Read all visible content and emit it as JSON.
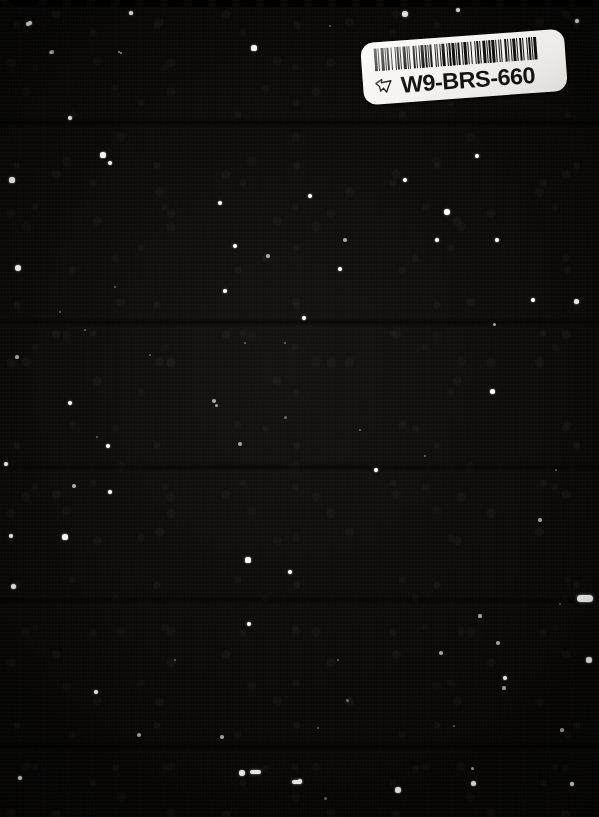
{
  "image": {
    "kind": "scanned-book-cover",
    "description": "Dark starfield / night sky book cover scan",
    "width": 599,
    "height": 817,
    "background_color": "#0b0908"
  },
  "label": {
    "name": "library-barcode-label",
    "code_text": "W9-BRS-660",
    "background_color": "#f6f5f1",
    "ink_color": "#141414",
    "icon": "pointing-hand-icon",
    "rotation_degrees": -4.2,
    "barcode": {
      "symbology": "code-39",
      "bars": [
        3,
        1,
        1,
        2,
        3,
        1,
        1,
        1,
        2,
        2,
        1,
        3,
        1,
        1,
        2,
        1,
        1,
        2,
        3,
        1,
        1,
        1,
        1,
        3,
        2,
        1,
        1,
        2,
        1,
        1,
        3,
        1,
        2,
        1,
        1,
        1,
        2,
        3,
        1,
        1,
        1,
        2,
        1,
        1,
        3,
        2,
        1,
        1,
        2,
        1,
        3,
        1,
        1,
        1,
        2,
        2,
        1,
        1,
        3,
        1,
        1,
        2,
        1,
        3,
        1,
        1,
        2,
        1,
        1,
        2,
        3,
        1,
        1,
        1,
        2,
        1,
        3,
        1,
        1,
        2,
        1,
        1,
        1,
        3,
        2,
        1,
        1,
        2,
        1,
        1,
        3,
        1,
        1,
        2,
        2,
        1,
        1,
        3,
        1,
        1,
        2,
        1,
        1,
        1,
        3,
        2
      ]
    }
  },
  "starfield": {
    "name": "starfield",
    "star_count": 118,
    "star_color": "#ffffff",
    "stars": [
      {
        "x": 405,
        "y": 14,
        "r": 3.0,
        "c": "bright"
      },
      {
        "x": 458,
        "y": 10,
        "r": 2.0,
        "c": "bright"
      },
      {
        "x": 577,
        "y": 21,
        "r": 2.4,
        "c": "bright"
      },
      {
        "x": 28,
        "y": 24,
        "r": 2.2,
        "c": "bright"
      },
      {
        "x": 131,
        "y": 13,
        "r": 1.8,
        "c": "bright"
      },
      {
        "x": 254,
        "y": 48,
        "r": 2.6,
        "c": "bright"
      },
      {
        "x": 330,
        "y": 26,
        "r": 1.3,
        "c": "faint"
      },
      {
        "x": 30,
        "y": 23,
        "r": 2.3,
        "c": "bright"
      },
      {
        "x": 50,
        "y": 52,
        "r": 1.5,
        "c": "dim"
      },
      {
        "x": 119,
        "y": 52,
        "r": 1.4,
        "c": "dim"
      },
      {
        "x": 103,
        "y": 155,
        "r": 2.6,
        "c": "bright"
      },
      {
        "x": 52,
        "y": 52,
        "r": 1.6,
        "c": "dim"
      },
      {
        "x": 121,
        "y": 53,
        "r": 1.4,
        "c": "dim"
      },
      {
        "x": 70,
        "y": 118,
        "r": 2.1,
        "c": "bright"
      },
      {
        "x": 12,
        "y": 180,
        "r": 2.6,
        "c": "bright"
      },
      {
        "x": 110,
        "y": 163,
        "r": 2.0,
        "c": "bright"
      },
      {
        "x": 405,
        "y": 180,
        "r": 2.2,
        "c": "bright"
      },
      {
        "x": 477,
        "y": 156,
        "r": 1.9,
        "c": "bright"
      },
      {
        "x": 220,
        "y": 203,
        "r": 2.3,
        "c": "bright"
      },
      {
        "x": 310,
        "y": 196,
        "r": 2.0,
        "c": "bright"
      },
      {
        "x": 447,
        "y": 212,
        "r": 2.9,
        "c": "bright"
      },
      {
        "x": 497,
        "y": 240,
        "r": 2.2,
        "c": "bright"
      },
      {
        "x": 235,
        "y": 246,
        "r": 2.1,
        "c": "bright"
      },
      {
        "x": 340,
        "y": 269,
        "r": 2.3,
        "c": "bright"
      },
      {
        "x": 268,
        "y": 256,
        "r": 1.6,
        "c": "dim"
      },
      {
        "x": 345,
        "y": 240,
        "r": 1.8,
        "c": "dim"
      },
      {
        "x": 18,
        "y": 268,
        "r": 3.3,
        "c": "bright"
      },
      {
        "x": 225,
        "y": 291,
        "r": 2.2,
        "c": "bright"
      },
      {
        "x": 304,
        "y": 318,
        "r": 2.3,
        "c": "bright"
      },
      {
        "x": 437,
        "y": 240,
        "r": 2.0,
        "c": "bright"
      },
      {
        "x": 576,
        "y": 301,
        "r": 2.5,
        "c": "bright"
      },
      {
        "x": 115,
        "y": 287,
        "r": 1.4,
        "c": "faint"
      },
      {
        "x": 85,
        "y": 330,
        "r": 1.3,
        "c": "faint"
      },
      {
        "x": 494,
        "y": 324,
        "r": 1.5,
        "c": "dim"
      },
      {
        "x": 533,
        "y": 300,
        "r": 2.4,
        "c": "bright"
      },
      {
        "x": 17,
        "y": 357,
        "r": 1.6,
        "c": "dim"
      },
      {
        "x": 245,
        "y": 343,
        "r": 1.4,
        "c": "faint"
      },
      {
        "x": 70,
        "y": 403,
        "r": 2.1,
        "c": "bright"
      },
      {
        "x": 492,
        "y": 391,
        "r": 2.5,
        "c": "bright"
      },
      {
        "x": 214,
        "y": 401,
        "r": 1.8,
        "c": "dim"
      },
      {
        "x": 376,
        "y": 470,
        "r": 2.3,
        "c": "bright"
      },
      {
        "x": 108,
        "y": 446,
        "r": 2.4,
        "c": "bright"
      },
      {
        "x": 240,
        "y": 444,
        "r": 1.9,
        "c": "dim"
      },
      {
        "x": 6,
        "y": 464,
        "r": 2.4,
        "c": "bright"
      },
      {
        "x": 285,
        "y": 417,
        "r": 1.5,
        "c": "faint"
      },
      {
        "x": 74,
        "y": 486,
        "r": 1.7,
        "c": "dim"
      },
      {
        "x": 110,
        "y": 492,
        "r": 2.4,
        "c": "bright"
      },
      {
        "x": 216,
        "y": 405,
        "r": 1.5,
        "c": "dim"
      },
      {
        "x": 11,
        "y": 536,
        "r": 2.1,
        "c": "bright"
      },
      {
        "x": 65,
        "y": 537,
        "r": 2.6,
        "c": "bright"
      },
      {
        "x": 248,
        "y": 560,
        "r": 2.6,
        "c": "bright"
      },
      {
        "x": 290,
        "y": 572,
        "r": 2.2,
        "c": "bright"
      },
      {
        "x": 13,
        "y": 586,
        "r": 2.5,
        "c": "bright"
      },
      {
        "x": 249,
        "y": 624,
        "r": 2.0,
        "c": "bright"
      },
      {
        "x": 540,
        "y": 520,
        "r": 1.8,
        "c": "dim"
      },
      {
        "x": 480,
        "y": 616,
        "r": 1.6,
        "c": "dim"
      },
      {
        "x": 498,
        "y": 643,
        "r": 1.8,
        "c": "dim"
      },
      {
        "x": 589,
        "y": 660,
        "r": 2.8,
        "c": "bright"
      },
      {
        "x": 505,
        "y": 678,
        "r": 2.2,
        "c": "bright"
      },
      {
        "x": 441,
        "y": 653,
        "r": 1.8,
        "c": "dim"
      },
      {
        "x": 504,
        "y": 688,
        "r": 1.6,
        "c": "dim"
      },
      {
        "x": 562,
        "y": 730,
        "r": 1.6,
        "c": "dim"
      },
      {
        "x": 96,
        "y": 692,
        "r": 2.2,
        "c": "bright"
      },
      {
        "x": 139,
        "y": 735,
        "r": 1.8,
        "c": "dim"
      },
      {
        "x": 222,
        "y": 737,
        "r": 1.7,
        "c": "dim"
      },
      {
        "x": 242,
        "y": 773,
        "r": 2.9,
        "c": "bright"
      },
      {
        "x": 300,
        "y": 781,
        "r": 2.1,
        "c": "bright"
      },
      {
        "x": 398,
        "y": 790,
        "r": 2.7,
        "c": "bright"
      },
      {
        "x": 473,
        "y": 783,
        "r": 2.5,
        "c": "bright"
      },
      {
        "x": 572,
        "y": 784,
        "r": 2.4,
        "c": "bright"
      },
      {
        "x": 20,
        "y": 778,
        "r": 2.0,
        "c": "bright"
      },
      {
        "x": 472,
        "y": 768,
        "r": 1.5,
        "c": "dim"
      },
      {
        "x": 325,
        "y": 798,
        "r": 1.5,
        "c": "faint"
      },
      {
        "x": 175,
        "y": 660,
        "r": 1.4,
        "c": "faint"
      },
      {
        "x": 338,
        "y": 660,
        "r": 1.3,
        "c": "faint"
      },
      {
        "x": 347,
        "y": 700,
        "r": 1.5,
        "c": "faint"
      },
      {
        "x": 318,
        "y": 728,
        "r": 1.4,
        "c": "faint"
      },
      {
        "x": 454,
        "y": 726,
        "r": 1.4,
        "c": "faint"
      },
      {
        "x": 560,
        "y": 604,
        "r": 1.3,
        "c": "faint"
      },
      {
        "x": 97,
        "y": 437,
        "r": 1.4,
        "c": "faint"
      },
      {
        "x": 285,
        "y": 343,
        "r": 1.3,
        "c": "faint"
      },
      {
        "x": 60,
        "y": 312,
        "r": 1.3,
        "c": "faint"
      },
      {
        "x": 150,
        "y": 355,
        "r": 1.3,
        "c": "faint"
      },
      {
        "x": 360,
        "y": 430,
        "r": 1.3,
        "c": "faint"
      },
      {
        "x": 425,
        "y": 456,
        "r": 1.3,
        "c": "faint"
      },
      {
        "x": 556,
        "y": 470,
        "r": 1.3,
        "c": "faint"
      }
    ],
    "streaks": [
      {
        "x": 585,
        "y": 598,
        "w": 16,
        "h": 7
      },
      {
        "x": 255,
        "y": 772,
        "w": 11,
        "h": 4
      },
      {
        "x": 297,
        "y": 782,
        "w": 10,
        "h": 4
      }
    ]
  }
}
